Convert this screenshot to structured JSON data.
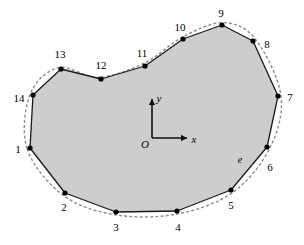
{
  "figure": {
    "title": "",
    "fill_color": "#cdcdcd",
    "stroke_color": "#1a1a1a",
    "dashed_color": "#8c8c8c",
    "background": "#ffffff",
    "width": 304,
    "height": 245
  },
  "chart_data": {
    "type": "scatter",
    "title": "",
    "xlabel": "x",
    "ylabel": "y",
    "grid": false,
    "legend": null,
    "origin_label": "O",
    "edge_label": "e",
    "node_labels": [
      "1",
      "2",
      "3",
      "4",
      "5",
      "6",
      "7",
      "8",
      "9",
      "10",
      "11",
      "12",
      "13",
      "14"
    ],
    "points": [
      {
        "label": "1",
        "px": 30,
        "py": 148,
        "lx": 18,
        "ly": 149
      },
      {
        "label": "2",
        "px": 65,
        "py": 193,
        "lx": 64,
        "ly": 207
      },
      {
        "label": "3",
        "px": 116,
        "py": 212,
        "lx": 116,
        "ly": 227
      },
      {
        "label": "4",
        "px": 177,
        "py": 211,
        "lx": 178,
        "ly": 227
      },
      {
        "label": "5",
        "px": 231,
        "py": 190,
        "lx": 231,
        "ly": 205
      },
      {
        "label": "6",
        "px": 267,
        "py": 147,
        "lx": 270,
        "ly": 167
      },
      {
        "label": "7",
        "px": 278,
        "py": 96,
        "lx": 290,
        "ly": 97
      },
      {
        "label": "8",
        "px": 253,
        "py": 41,
        "lx": 267,
        "ly": 44
      },
      {
        "label": "9",
        "px": 222,
        "py": 25,
        "lx": 221,
        "ly": 13
      },
      {
        "label": "10",
        "px": 183,
        "py": 39,
        "lx": 180,
        "ly": 27
      },
      {
        "label": "11",
        "px": 145,
        "py": 66,
        "lx": 142,
        "ly": 53
      },
      {
        "label": "12",
        "px": 101,
        "py": 79,
        "lx": 101,
        "ly": 65
      },
      {
        "label": "13",
        "px": 61,
        "py": 69,
        "lx": 60,
        "ly": 54
      },
      {
        "label": "14",
        "px": 33,
        "py": 95,
        "lx": 19,
        "ly": 98
      }
    ],
    "axes": {
      "origin": {
        "px": 152,
        "py": 138
      },
      "x_tip": {
        "px": 187,
        "py": 138
      },
      "y_tip": {
        "px": 152,
        "py": 99
      },
      "x_label_pos": {
        "lx": 194,
        "ly": 139
      },
      "y_label_pos": {
        "lx": 159,
        "ly": 98
      },
      "origin_label_pos": {
        "lx": 145,
        "ly": 144
      }
    },
    "edge_annotation": {
      "label": "e",
      "lx": 240,
      "ly": 160
    }
  }
}
